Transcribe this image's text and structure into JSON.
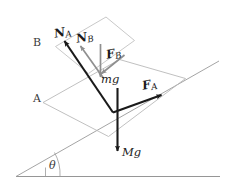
{
  "figure": {
    "colors": {
      "outline": "#b9b9b9",
      "ground": "#8a8a8a",
      "incline": "#9a9a9a",
      "vector_dark": "#1a1a1a",
      "vector_gray": "#8f8f8f",
      "text": "#2a2a2a"
    }
  },
  "labels": {
    "block_a": "A",
    "block_b": "B",
    "angle": "θ",
    "normal_a": "N",
    "normal_a_sub": "A",
    "normal_b": "N",
    "normal_b_sub": "B",
    "force_a": "F",
    "force_a_sub": "A",
    "force_b": "F",
    "force_b_sub": "B",
    "weight_small": "mg",
    "weight_large": "Mg"
  },
  "vectors": [
    {
      "name": "N_A",
      "label": "N",
      "subscript": "A",
      "style": "dark",
      "description": "normal force on block A, perpendicular to incline, pointing up-left"
    },
    {
      "name": "N_B",
      "label": "N",
      "subscript": "B",
      "style": "gray",
      "description": "normal force on block B, perpendicular to incline, pointing up-left"
    },
    {
      "name": "F_A",
      "label": "F",
      "subscript": "A",
      "style": "dark",
      "description": "applied force on block A, up the incline"
    },
    {
      "name": "F_B",
      "label": "F",
      "subscript": "B",
      "style": "gray",
      "description": "applied force on block B, down the incline"
    },
    {
      "name": "mg",
      "label": "mg",
      "subscript": "",
      "style": "gray",
      "description": "weight of small block B, straight down"
    },
    {
      "name": "Mg",
      "label": "Mg",
      "subscript": "",
      "style": "dark",
      "description": "weight of large block A, straight down"
    }
  ],
  "geometry": {
    "incline_angle_label": "θ",
    "ground_line": "horizontal base line",
    "incline_line": "inclined surface rising to the right"
  }
}
